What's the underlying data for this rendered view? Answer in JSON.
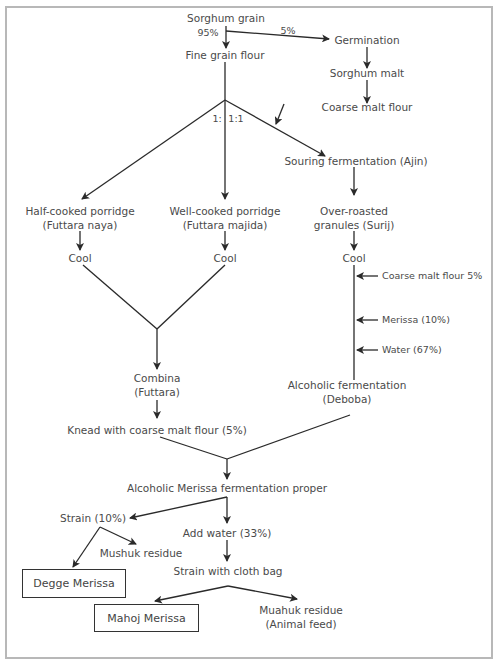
{
  "diagram": {
    "nodes": {
      "sorghum_grain": "Sorghum grain",
      "pct_95": "95%",
      "pct_5": "5%",
      "germination": "Germination",
      "sorghum_malt": "Sorghum malt",
      "coarse_malt_flour": "Coarse malt flour",
      "fine_grain_flour": "Fine grain flour",
      "ratio_left": "1:",
      "ratio_right": "1:1",
      "souring_fermentation": "Souring fermentation (Ajin)",
      "half_cooked_line1": "Half-cooked porridge",
      "half_cooked_line2": "(Futtara naya)",
      "well_cooked_line1": "Well-cooked porridge",
      "well_cooked_line2": "(Futtara majida)",
      "over_roasted_line1": "Over-roasted",
      "over_roasted_line2": "granules (Surij)",
      "cool_left": "Cool",
      "cool_middle": "Cool",
      "cool_right": "Cool",
      "add_coarse_malt": "Coarse malt flour 5%",
      "add_merissa": "Merissa (10%)",
      "add_water": "Water (67%)",
      "alcoholic_fermentation_line1": "Alcoholic fermentation",
      "alcoholic_fermentation_line2": "(Deboba)",
      "combina_line1": "Combina",
      "combina_line2": "(Futtara)",
      "knead": "Knead with coarse malt flour (5%)",
      "merissa_fermentation_proper": "Alcoholic Merissa fermentation proper",
      "strain_10": "Strain (10%)",
      "add_water_33": "Add water (33%)",
      "mushuk_residue": "Mushuk residue",
      "strain_cloth_bag": "Strain with cloth bag",
      "degge_merissa": "Degge Merissa",
      "mahoj_merissa": "Mahoj Merissa",
      "muahuk_residue_line1": "Muahuk residue",
      "muahuk_residue_line2": "(Animal feed)"
    },
    "colors": {
      "line": "#2a2a2a",
      "text": "#4a4a4a",
      "frame": "#b8b8b8"
    }
  }
}
